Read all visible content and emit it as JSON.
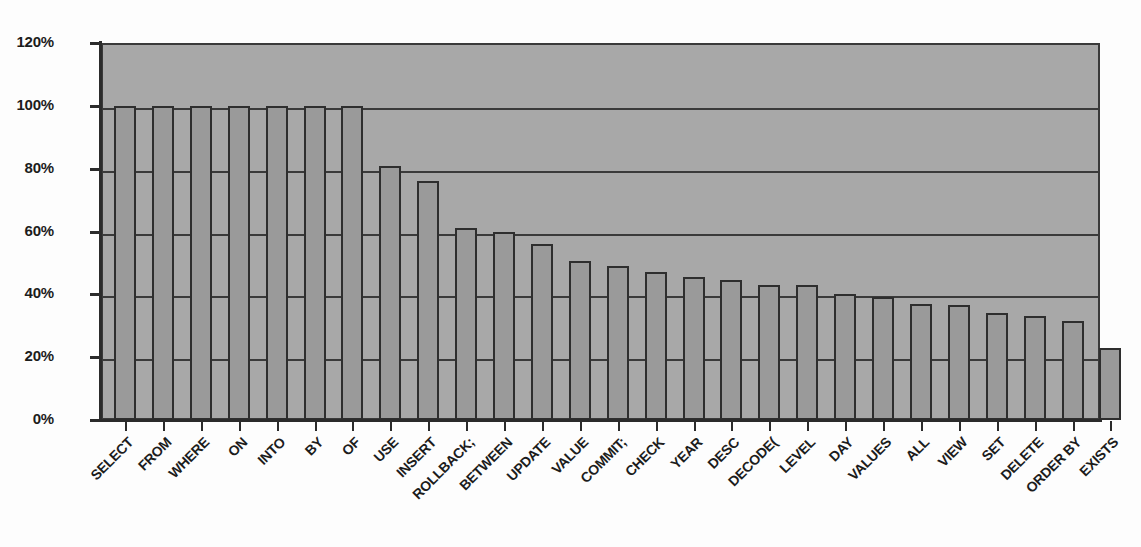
{
  "chart_data": {
    "type": "bar",
    "title": "",
    "subtitle": "",
    "xlabel": "",
    "ylabel": "",
    "ylim": [
      0,
      1.2
    ],
    "y_tick_labels": [
      "120%",
      "100%",
      "80%",
      "60%",
      "40%",
      "20%",
      "0%"
    ],
    "y_tick_values": [
      1.2,
      1.0,
      0.8,
      0.6,
      0.4,
      0.2,
      0.0
    ],
    "grid": true,
    "grid_axis": "y",
    "legend": false,
    "legend_position": "none",
    "categories": [
      "SELECT",
      "FROM",
      "WHERE",
      "ON",
      "INTO",
      "BY",
      "OF",
      "USE",
      "INSERT",
      "ROLLBACK;",
      "BETWEEN",
      "UPDATE",
      "VALUE",
      "COMMIT;",
      "CHECK",
      "YEAR",
      "DESC",
      "DECODE(",
      "LEVEL",
      "DAY",
      "VALUES",
      "ALL",
      "VIEW",
      "SET",
      "DELETE",
      "ORDER BY",
      "EXISTS"
    ],
    "values": [
      1.0,
      1.0,
      1.0,
      1.0,
      1.0,
      1.0,
      1.0,
      0.81,
      0.76,
      0.61,
      0.6,
      0.56,
      0.505,
      0.49,
      0.47,
      0.455,
      0.445,
      0.43,
      0.43,
      0.4,
      0.39,
      0.37,
      0.365,
      0.34,
      0.33,
      0.315,
      0.23
    ],
    "value_labels": [
      "100%",
      "100%",
      "100%",
      "100%",
      "100%",
      "100%",
      "100%",
      "81%",
      "76%",
      "61%",
      "60%",
      "56%",
      "51%",
      "49%",
      "47%",
      "46%",
      "45%",
      "43%",
      "43%",
      "40%",
      "39%",
      "37%",
      "37%",
      "34%",
      "33%",
      "32%",
      "23%"
    ],
    "colors": {
      "bar_fill": "#9a9a9a",
      "bar_edge": "#2e2e2e",
      "plot_background": "#a8a8a8",
      "grid_color": "#3a3a3a",
      "axis_color": "#2b2b2b",
      "text_color": "#1c1c1c",
      "figure_background": "#fdfdfd"
    }
  }
}
